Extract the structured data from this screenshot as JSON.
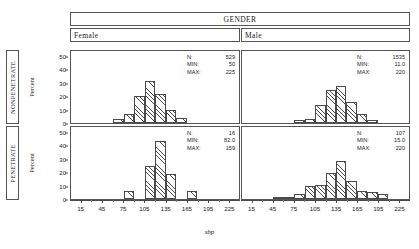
{
  "header": {
    "group_title": "GENDER",
    "columns": [
      "Female",
      "Male"
    ]
  },
  "rows": [
    "NONPENETRATE",
    "PENETRATE"
  ],
  "axis": {
    "xlabel": "sbp",
    "ylabel": "Percent",
    "xticks": [
      15,
      45,
      75,
      105,
      135,
      165,
      195,
      225
    ],
    "yticks": [
      0,
      10,
      20,
      30,
      40,
      50
    ],
    "xlim": [
      0,
      240
    ],
    "ylim": [
      0,
      55
    ]
  },
  "stats_labels": {
    "n": "N:",
    "min": "MIN:",
    "max": "MAX:"
  },
  "panels": {
    "female_nonpenetrate": {
      "stats": {
        "n": "529",
        "min": "50",
        "max": "225"
      }
    },
    "male_nonpenetrate": {
      "stats": {
        "n": "1535",
        "min": "11.0",
        "max": "220"
      }
    },
    "female_penetrate": {
      "stats": {
        "n": "16",
        "min": "82.0",
        "max": "159"
      }
    },
    "male_penetrate": {
      "stats": {
        "n": "107",
        "min": "15.0",
        "max": "220"
      }
    }
  },
  "chart_data": {
    "type": "bar",
    "title": "",
    "xlabel": "sbp",
    "ylabel": "Percent",
    "xlim": [
      0,
      240
    ],
    "ylim": [
      0,
      55
    ],
    "grid": false,
    "legend": null,
    "bin_width": 15,
    "panel_layout": {
      "rows": [
        "NONPENETRATE",
        "PENETRATE"
      ],
      "columns": [
        "Female",
        "Male"
      ],
      "column_group": "GENDER"
    },
    "panels": [
      {
        "row": "NONPENETRATE",
        "column": "Female",
        "n": 529,
        "min": 50,
        "max": 225,
        "bins": [
          67.5,
          82.5,
          97.5,
          112.5,
          127.5,
          142.5,
          157.5
        ],
        "values": [
          3,
          7,
          21,
          32,
          22,
          10,
          4
        ]
      },
      {
        "row": "NONPENETRATE",
        "column": "Male",
        "n": 1535,
        "min": 11.0,
        "max": 220,
        "bins": [
          82.5,
          97.5,
          112.5,
          127.5,
          142.5,
          157.5,
          172.5,
          187.5
        ],
        "values": [
          2,
          3,
          14,
          25,
          28,
          16,
          7,
          2
        ]
      },
      {
        "row": "PENETRATE",
        "column": "Female",
        "n": 16,
        "min": 82.0,
        "max": 159,
        "bins": [
          82.5,
          112.5,
          127.5,
          142.5,
          172.5
        ],
        "values": [
          6.25,
          25,
          44,
          19,
          6.25
        ]
      },
      {
        "row": "PENETRATE",
        "column": "Male",
        "n": 107,
        "min": 15.0,
        "max": 220,
        "bins": [
          52.5,
          67.5,
          82.5,
          97.5,
          112.5,
          127.5,
          142.5,
          157.5,
          172.5,
          187.5,
          202.5
        ],
        "values": [
          1,
          1,
          4,
          10,
          11,
          20,
          29,
          14,
          6,
          5,
          4
        ]
      }
    ]
  }
}
